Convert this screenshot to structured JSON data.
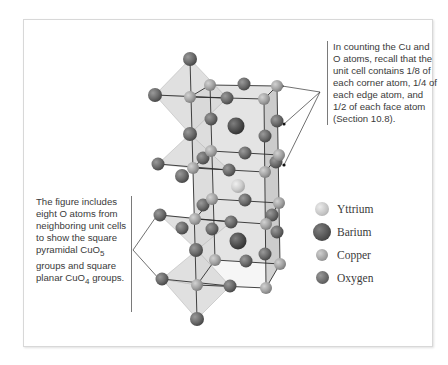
{
  "figure": {
    "note_right": "In counting the Cu and O atoms, recall that the unit cell contains 1/8 of each corner atom, 1/4 of each edge atom, and 1/2 of each face atom (Section 10.8).",
    "note_left_parts": {
      "p1": "The figure includes eight O atoms from neighboring unit cells to show the square pyramidal CuO",
      "sub1": "5",
      "p2": " groups and square planar CuO",
      "sub2": "4",
      "p3": " groups."
    }
  },
  "legend": {
    "items": [
      {
        "label": "Yttrium",
        "color": "#c3c3c3",
        "size": 14
      },
      {
        "label": "Barium",
        "color": "#555555",
        "size": 18
      },
      {
        "label": "Copper",
        "color": "#9b9b9b",
        "size": 12
      },
      {
        "label": "Oxygen",
        "color": "#6a6a6a",
        "size": 13
      }
    ]
  },
  "colors": {
    "oxygen": "#6a6a6a",
    "copper": "#a4a4a4",
    "barium": "#505050",
    "yttrium": "#cfcfcf",
    "polyhedron": "#dcdcdc",
    "cell_face": "#d4d4d4"
  }
}
